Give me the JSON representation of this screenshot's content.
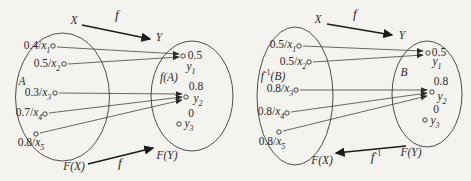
{
  "colors": {
    "background": "#f4f3ef",
    "ink": "#2b2b2b"
  },
  "left_diagram": {
    "domain_label": "X",
    "codomain_label": "Y",
    "map_label": "f",
    "power_domain_label": "F(X)",
    "power_codomain_label": "F(Y)",
    "power_map_label": "f",
    "set_label": "A",
    "image_set_label": {
      "base": "f",
      "arg": "(A)"
    },
    "source_elements": [
      {
        "grade": "0.4/",
        "var": "x",
        "sub": "1"
      },
      {
        "grade": "0.5/",
        "var": "x",
        "sub": "2"
      },
      {
        "grade": "0.3/",
        "var": "x",
        "sub": "3"
      },
      {
        "grade": "0.7/",
        "var": "x",
        "sub": "4"
      },
      {
        "grade": "0.8/",
        "var": "x",
        "sub": "5"
      }
    ],
    "target_values": [
      "0.5",
      "0.8",
      "0"
    ],
    "target_elements": [
      {
        "var": "y",
        "sub": "1"
      },
      {
        "var": "y",
        "sub": "2"
      },
      {
        "var": "y",
        "sub": "3"
      }
    ]
  },
  "right_diagram": {
    "domain_label": "X",
    "codomain_label": "Y",
    "map_label": "f",
    "power_domain_label": "F(X)",
    "power_codomain_label": "F(Y)",
    "inverse_map_label": {
      "base": "f",
      "sup": "-1"
    },
    "set_label": "B",
    "preimage_set_label": {
      "base": "f",
      "sup": "-1",
      "arg": "(B)"
    },
    "source_elements": [
      {
        "grade": "0.5/",
        "var": "x",
        "sub": "1"
      },
      {
        "grade": "0.5/",
        "var": "x",
        "sub": "2"
      },
      {
        "grade": "0.8/",
        "var": "x",
        "sub": "3"
      },
      {
        "grade": "0.8/",
        "var": "x",
        "sub": "4"
      },
      {
        "grade": "0.8/",
        "var": "x",
        "sub": "5"
      }
    ],
    "target_values": [
      "0.5",
      "0.8",
      "0"
    ],
    "target_elements": [
      {
        "var": "y",
        "sub": "1"
      },
      {
        "var": "y",
        "sub": "2"
      },
      {
        "var": "y",
        "sub": "3"
      }
    ]
  }
}
